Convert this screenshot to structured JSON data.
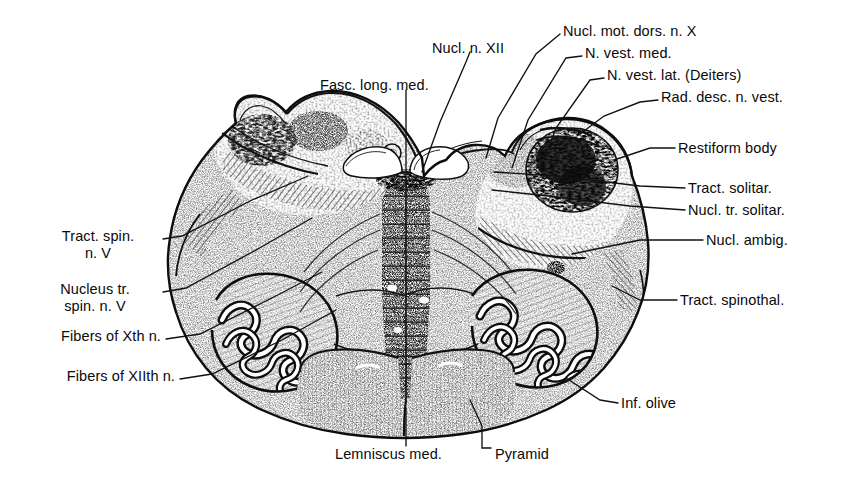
{
  "figure": {
    "ink_color": "#0a0a0a",
    "background_color": "#ffffff",
    "leader_line_color": "#111111"
  },
  "labels": [
    {
      "id": "nucl-mot-dors-n-x",
      "text": "Nucl. mot. dors. n. X",
      "align": "left",
      "x": 563,
      "y": 30
    },
    {
      "id": "n-vest-med",
      "text": "N. vest. med.",
      "align": "left",
      "x": 585,
      "y": 52
    },
    {
      "id": "n-vest-lat",
      "text": "N. vest. lat. (Deiters)",
      "align": "left",
      "x": 607,
      "y": 74
    },
    {
      "id": "rad-desc-n-vest",
      "text": "Rad. desc. n. vest.",
      "align": "left",
      "x": 661,
      "y": 96
    },
    {
      "id": "restiform-body",
      "text": "Restiform body",
      "align": "left",
      "x": 678,
      "y": 144
    },
    {
      "id": "tract-solitar",
      "text": "Tract. solitar.",
      "align": "left",
      "x": 688,
      "y": 184
    },
    {
      "id": "nucl-tr-solitar",
      "text": "Nucl. tr. solitar.",
      "align": "left",
      "x": 688,
      "y": 206
    },
    {
      "id": "nucl-ambig",
      "text": "Nucl. ambig.",
      "align": "left",
      "x": 706,
      "y": 236
    },
    {
      "id": "tract-spinothal",
      "text": "Tract. spinothal.",
      "align": "left",
      "x": 680,
      "y": 296
    },
    {
      "id": "inf-olive",
      "text": "Inf. olive",
      "align": "left",
      "x": 621,
      "y": 399
    },
    {
      "id": "nucl-n-xii",
      "text": "Nucl. n. XII",
      "align": "left",
      "x": 432,
      "y": 47
    },
    {
      "id": "fasc-long-med",
      "text": "Fasc. long. med.",
      "align": "left",
      "x": 320,
      "y": 84
    },
    {
      "id": "tract-spin-n-v",
      "text": "Tract. spin.\nn. V",
      "align": "right",
      "x": 158,
      "y": 235
    },
    {
      "id": "nucleus-tr-spin-n-v",
      "text": "Nucleus tr.\nspin. n. V",
      "align": "right",
      "x": 158,
      "y": 288
    },
    {
      "id": "fibers-of-xth-n",
      "text": "Fibers of Xth n.",
      "align": "right",
      "x": 161,
      "y": 335
    },
    {
      "id": "fibers-of-xiith-n",
      "text": "Fibers of XIIth n.",
      "align": "right",
      "x": 175,
      "y": 375
    },
    {
      "id": "lemniscus-med",
      "text": "Lemniscus med.",
      "align": "left",
      "x": 335,
      "y": 453
    },
    {
      "id": "pyramid",
      "text": "Pyramid",
      "align": "left",
      "x": 495,
      "y": 453
    }
  ],
  "structures": [
    {
      "id": "dorsal-left-wing",
      "name": "gracile and cuneate tubercle, left"
    },
    {
      "id": "dorsal-right-wing",
      "name": "vestibular area and restiform body, right"
    },
    {
      "id": "inferior-olive-left",
      "name": "inferior olivary nucleus, left"
    },
    {
      "id": "inferior-olive-right",
      "name": "inferior olivary nucleus, right"
    },
    {
      "id": "medial-lemniscus",
      "name": "medial lemniscus band, midline"
    },
    {
      "id": "pyramid-left",
      "name": "pyramidal tract, left"
    },
    {
      "id": "pyramid-right",
      "name": "pyramidal tract, right"
    },
    {
      "id": "central-canal",
      "name": "central canal region"
    }
  ]
}
